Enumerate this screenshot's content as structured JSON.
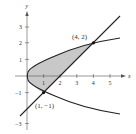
{
  "figure": {
    "type": "region-between-curves",
    "curves": [
      {
        "name": "parabola",
        "equation": "x = y^2"
      },
      {
        "name": "line",
        "equation": "y = x - 2"
      }
    ],
    "shaded_region": "between parabola and line from y = -1 to y = 2",
    "points": [
      {
        "label": "(4, 2)",
        "x": 4,
        "y": 2
      },
      {
        "label": "(1, −1)",
        "x": 1,
        "y": -1
      }
    ],
    "axes": {
      "x_label": "x",
      "y_label": "y",
      "x_ticks": [
        {
          "value": 1,
          "label": "1"
        },
        {
          "value": 2,
          "label": "2"
        },
        {
          "value": 3,
          "label": "3"
        },
        {
          "value": 4,
          "label": "4"
        },
        {
          "value": 5,
          "label": "5"
        }
      ],
      "y_ticks": [
        {
          "value": 3,
          "label": "3"
        },
        {
          "value": 2,
          "label": "2"
        },
        {
          "value": 1,
          "label": "1"
        },
        {
          "value": -1,
          "label": "−1"
        },
        {
          "value": -3,
          "label": "−3"
        }
      ]
    },
    "colors": {
      "curve": "#222222",
      "shade": "#c8c8c8",
      "axis": "#555555"
    }
  }
}
